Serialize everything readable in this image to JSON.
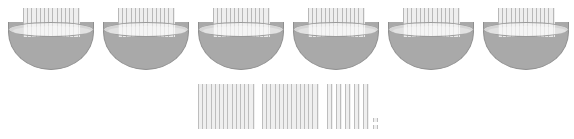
{
  "scene": {
    "title": "Base-ten blocks in bowls",
    "background_color": "#ffffff",
    "block_color": "#b8b8b8",
    "bowl_color": "#a9a9a9",
    "bowl_rim_color": "#f7f7f7"
  },
  "bowls_row": {
    "label": "Bowls each holding one hundred-flat",
    "count": 6,
    "items": [
      {
        "name": "bowl-1",
        "contents": "hundred-flat",
        "value": 100,
        "x": 8,
        "y": 22
      },
      {
        "name": "bowl-2",
        "contents": "hundred-flat",
        "value": 100,
        "x": 103,
        "y": 22
      },
      {
        "name": "bowl-3",
        "contents": "hundred-flat",
        "value": 100,
        "x": 198,
        "y": 22
      },
      {
        "name": "bowl-4",
        "contents": "hundred-flat",
        "value": 100,
        "x": 293,
        "y": 22
      },
      {
        "name": "bowl-5",
        "contents": "hundred-flat",
        "value": 100,
        "x": 388,
        "y": 22
      },
      {
        "name": "bowl-6",
        "contents": "hundred-flat",
        "value": 100,
        "x": 483,
        "y": 22
      }
    ]
  },
  "loose_row": {
    "label": "Loose base-ten blocks",
    "flats": {
      "name": "hundred-flats",
      "count": 2,
      "unit_value": 100,
      "items": [
        {
          "name": "flat-1",
          "x": 198,
          "y": 84,
          "w": 57,
          "h": 45
        },
        {
          "name": "flat-2",
          "x": 262,
          "y": 84,
          "w": 57,
          "h": 45
        }
      ]
    },
    "rods": {
      "name": "ten-rods",
      "count": 5,
      "unit_value": 10,
      "items": [
        {
          "name": "rod-1",
          "x": 327,
          "y": 84,
          "w": 6,
          "h": 45
        },
        {
          "name": "rod-2",
          "x": 336,
          "y": 84,
          "w": 6,
          "h": 45
        },
        {
          "name": "rod-3",
          "x": 345,
          "y": 84,
          "w": 6,
          "h": 45
        },
        {
          "name": "rod-4",
          "x": 354,
          "y": 84,
          "w": 6,
          "h": 45
        },
        {
          "name": "rod-5",
          "x": 363,
          "y": 84,
          "w": 6,
          "h": 45
        }
      ]
    },
    "units": {
      "name": "one-units",
      "count": 2,
      "unit_value": 1,
      "items": [
        {
          "name": "unit-1",
          "x": 373,
          "y": 118,
          "w": 5,
          "h": 4
        },
        {
          "name": "unit-2",
          "x": 373,
          "y": 125,
          "w": 5,
          "h": 4
        }
      ]
    }
  },
  "totals": {
    "bowls_total": 600,
    "loose_flats_total": 200,
    "loose_rods_total": 50,
    "loose_units_total": 2,
    "grand_total": 852
  }
}
